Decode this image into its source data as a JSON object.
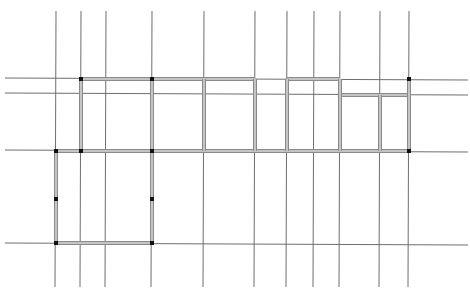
{
  "canvas": {
    "width": 470,
    "height": 296,
    "background": "#ffffff"
  },
  "colors": {
    "grid": "#6e6e6e",
    "wall_outer": "#8a8a8a",
    "wall_inner": "#c4c4c4",
    "node": "#111111"
  },
  "grid_lines": {
    "vertical": [
      {
        "x1": 56,
        "y1": 11,
        "x2": 55,
        "y2": 287
      },
      {
        "x1": 81,
        "y1": 11,
        "x2": 80,
        "y2": 287
      },
      {
        "x1": 106,
        "y1": 11,
        "x2": 105,
        "y2": 287
      },
      {
        "x1": 152,
        "y1": 11,
        "x2": 151,
        "y2": 287
      },
      {
        "x1": 204,
        "y1": 11,
        "x2": 203,
        "y2": 287
      },
      {
        "x1": 255,
        "y1": 11,
        "x2": 254,
        "y2": 287
      },
      {
        "x1": 287,
        "y1": 11,
        "x2": 286,
        "y2": 287
      },
      {
        "x1": 314,
        "y1": 11,
        "x2": 313,
        "y2": 287
      },
      {
        "x1": 340,
        "y1": 11,
        "x2": 339,
        "y2": 287
      },
      {
        "x1": 380,
        "y1": 11,
        "x2": 379,
        "y2": 287
      },
      {
        "x1": 409,
        "y1": 11,
        "x2": 408,
        "y2": 287
      }
    ],
    "horizontal": [
      {
        "x1": 5,
        "y1": 78,
        "x2": 468,
        "y2": 80
      },
      {
        "x1": 5,
        "y1": 93,
        "x2": 468,
        "y2": 95
      },
      {
        "x1": 5,
        "y1": 150,
        "x2": 468,
        "y2": 152
      },
      {
        "x1": 5,
        "y1": 243,
        "x2": 468,
        "y2": 245
      }
    ]
  },
  "walls": [
    {
      "x1": 81,
      "y1": 79,
      "x2": 255,
      "y2": 79
    },
    {
      "x1": 287,
      "y1": 79,
      "x2": 340,
      "y2": 79
    },
    {
      "x1": 340,
      "y1": 95,
      "x2": 409,
      "y2": 95
    },
    {
      "x1": 56,
      "y1": 151,
      "x2": 409,
      "y2": 151
    },
    {
      "x1": 81,
      "y1": 79,
      "x2": 81,
      "y2": 151
    },
    {
      "x1": 152,
      "y1": 79,
      "x2": 152,
      "y2": 151
    },
    {
      "x1": 204,
      "y1": 79,
      "x2": 204,
      "y2": 151
    },
    {
      "x1": 255,
      "y1": 79,
      "x2": 255,
      "y2": 151
    },
    {
      "x1": 287,
      "y1": 79,
      "x2": 287,
      "y2": 151
    },
    {
      "x1": 340,
      "y1": 79,
      "x2": 340,
      "y2": 151
    },
    {
      "x1": 380,
      "y1": 95,
      "x2": 380,
      "y2": 151
    },
    {
      "x1": 409,
      "y1": 79,
      "x2": 409,
      "y2": 151
    },
    {
      "x1": 56,
      "y1": 151,
      "x2": 56,
      "y2": 243
    },
    {
      "x1": 152,
      "y1": 151,
      "x2": 152,
      "y2": 243
    },
    {
      "x1": 56,
      "y1": 243,
      "x2": 152,
      "y2": 243
    }
  ],
  "nodes": [
    {
      "x": 81,
      "y": 79
    },
    {
      "x": 152,
      "y": 79
    },
    {
      "x": 409,
      "y": 79
    },
    {
      "x": 56,
      "y": 151
    },
    {
      "x": 81,
      "y": 151
    },
    {
      "x": 152,
      "y": 151
    },
    {
      "x": 409,
      "y": 151
    },
    {
      "x": 56,
      "y": 199
    },
    {
      "x": 152,
      "y": 199
    },
    {
      "x": 56,
      "y": 243
    },
    {
      "x": 152,
      "y": 243
    }
  ]
}
